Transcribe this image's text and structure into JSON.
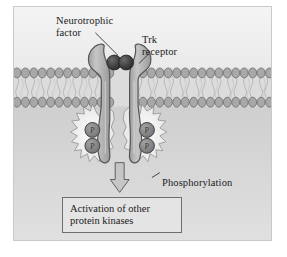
{
  "figure": {
    "background_color": "#f2f2f2",
    "frame_color": "#c9c9c9"
  },
  "regions": {
    "extracellular": {
      "name": "extracellular space",
      "color": "#f0f0f0"
    },
    "membrane": {
      "name": "plasma membrane phospholipid bilayer",
      "head_color": "#8f8f8f",
      "tail_color": "#cfcfcf",
      "head_count": 31
    },
    "cytoplasm": {
      "name": "cytoplasm",
      "color": "#d9d9d9"
    }
  },
  "labels": {
    "neurotrophic_factor": "Neurotrophic\nfactor",
    "trk_receptor": "Trk\nreceptor",
    "phosphorylation": "Phosphorylation"
  },
  "outcome": {
    "text": "Activation of other\nprotein kinases",
    "border_color": "#6e6e6e",
    "fill_color": "#e4e4e4"
  },
  "elements": {
    "ligand": {
      "name": "neurotrophic factor dimer",
      "color": "#3f3f3f",
      "sphere_count": 2
    },
    "receptor": {
      "name": "Trk receptor dimer",
      "fill_color": "#b8b8b8",
      "stroke_color": "#5a5a5a",
      "arm_count": 2
    },
    "phosphates": {
      "name": "phosphate groups",
      "letter": "P",
      "count": 4,
      "fill_color": "#8a8a8a",
      "stroke_color": "#4a4a4a"
    },
    "starbursts": {
      "name": "phosphorylation activation burst",
      "count": 2,
      "fill_color": "#f5f5f5",
      "stroke_color": "#8a8a8a"
    },
    "arrow": {
      "name": "downward signaling arrow",
      "fill_color": "#c4c4c4",
      "stroke_color": "#5a5a5a",
      "direction": "down"
    }
  },
  "leader_lines": {
    "neurotrophic_factor": "from label down-right to ligand spheres",
    "trk_receptor": "from label down-left to receptor arm",
    "phosphorylation": "from label up-left to right starburst"
  }
}
